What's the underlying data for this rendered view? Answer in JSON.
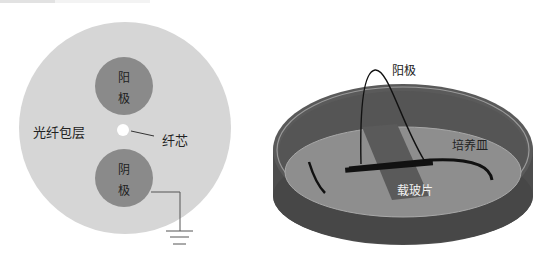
{
  "left_diagram": {
    "title": "Fiber cross-section",
    "labels": {
      "anode_char1": "阳",
      "anode_char2": "极",
      "cathode_char1": "阴",
      "cathode_char2": "极",
      "cladding": "光纤包层",
      "core": "纤芯"
    },
    "colors": {
      "cladding": "#d6d6d6",
      "electrode": "#8a8a8a",
      "core": "#ffffff",
      "wire": "#555555"
    }
  },
  "right_diagram": {
    "title": "Petri dish setup",
    "labels": {
      "anode": "阳极",
      "dish": "培养皿",
      "slide": "载玻片"
    },
    "colors": {
      "dish_wall": "#4d4d4d",
      "dish_floor": "#8e8e8e",
      "dish_rim": "#9a9a9a",
      "slide": "#5a5a5a",
      "wire": "#111111"
    }
  }
}
